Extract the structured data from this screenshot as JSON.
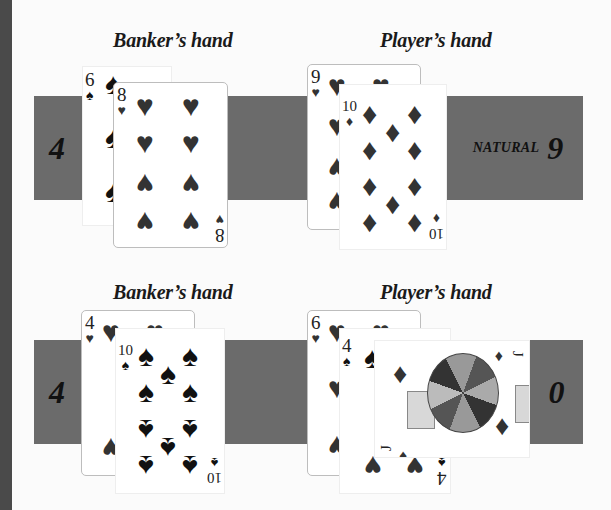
{
  "rounds": [
    {
      "banker": {
        "label": "Banker’s hand",
        "score": "4",
        "cards": [
          {
            "rank": "6",
            "suit": "spade",
            "suit_glyph": "♠"
          },
          {
            "rank": "8",
            "suit": "heart",
            "suit_glyph": "♥"
          }
        ]
      },
      "player": {
        "label": "Player’s hand",
        "score_prefix": "NATURAL",
        "score": "9",
        "cards": [
          {
            "rank": "9",
            "suit": "heart",
            "suit_glyph": "♥"
          },
          {
            "rank": "10",
            "suit": "diamond",
            "suit_glyph": "♦"
          }
        ]
      }
    },
    {
      "banker": {
        "label": "Banker’s hand",
        "score": "4",
        "cards": [
          {
            "rank": "4",
            "suit": "heart",
            "suit_glyph": "♥"
          },
          {
            "rank": "10",
            "suit": "spade",
            "suit_glyph": "♠"
          }
        ]
      },
      "player": {
        "label": "Player’s hand",
        "score": "0",
        "cards": [
          {
            "rank": "6",
            "suit": "heart",
            "suit_glyph": "♥"
          },
          {
            "rank": "4",
            "suit": "spade",
            "suit_glyph": "♠"
          },
          {
            "rank": "J",
            "suit": "diamond",
            "suit_glyph": "♦"
          }
        ]
      }
    }
  ],
  "colors": {
    "band": "#6b6b6b",
    "left_rule": "#4a4a4a",
    "background": "#fbfbfb"
  }
}
